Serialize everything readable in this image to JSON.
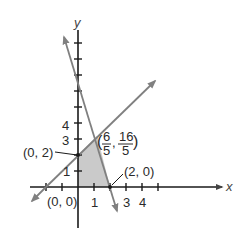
{
  "axes": {
    "x_label": "x",
    "y_label": "y"
  },
  "colors": {
    "axis": "#1a1a1a",
    "line": "#808080",
    "shade": "#c4c4c4",
    "text": "#2a2a2a"
  },
  "x_ticks": [
    "1",
    "3",
    "4"
  ],
  "y_ticks": [
    "1",
    "3",
    "4"
  ],
  "points": {
    "origin": "(0, 0)",
    "p02": "(0, 2)",
    "p20": "(2, 0)",
    "corner_open": "(",
    "corner_x_num": "6",
    "corner_x_den": "5",
    "corner_sep": ",",
    "corner_y_num": "16",
    "corner_y_den": "5",
    "corner_close": ")"
  },
  "region": {
    "vertices": [
      "(0, 0)",
      "(0, 2)",
      "(6/5, 16/5)",
      "(2, 0)"
    ]
  },
  "lines": [
    {
      "name": "y = x + 2"
    },
    {
      "name": "y = -4x + 8"
    }
  ]
}
